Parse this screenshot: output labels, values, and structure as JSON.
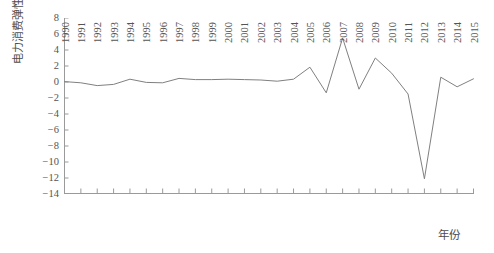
{
  "chart_data": {
    "type": "line",
    "title": "",
    "xlabel": "年份",
    "ylabel": "电力消费弹性系数",
    "categories": [
      1990,
      1991,
      1992,
      1993,
      1994,
      1995,
      1996,
      1997,
      1998,
      1999,
      2000,
      2001,
      2002,
      2003,
      2004,
      2005,
      2006,
      2007,
      2008,
      2009,
      2010,
      2011,
      2012,
      2013,
      2014,
      2015
    ],
    "x": [
      1990,
      1991,
      1992,
      1993,
      1994,
      1995,
      1996,
      1997,
      1998,
      1999,
      2000,
      2001,
      2002,
      2003,
      2004,
      2005,
      2006,
      2007,
      2008,
      2009,
      2010,
      2011,
      2012,
      2013,
      2014,
      2015
    ],
    "values": [
      0.05,
      -0.1,
      -0.45,
      -0.3,
      0.35,
      -0.05,
      -0.1,
      0.45,
      0.3,
      0.3,
      0.35,
      0.3,
      0.25,
      0.1,
      0.35,
      1.85,
      -1.35,
      5.5,
      -0.9,
      3.0,
      1.1,
      -1.5,
      -12.1,
      0.6,
      -0.6,
      0.4
    ],
    "series": [
      {
        "name": "电力消费弹性系数",
        "color": "#808080",
        "values": [
          0.05,
          -0.1,
          -0.45,
          -0.3,
          0.35,
          -0.05,
          -0.1,
          0.45,
          0.3,
          0.3,
          0.35,
          0.3,
          0.25,
          0.1,
          0.35,
          1.85,
          -1.35,
          5.5,
          -0.9,
          3.0,
          1.1,
          -1.5,
          -12.1,
          0.6,
          -0.6,
          0.4
        ]
      }
    ],
    "ylim": [
      -14,
      8
    ],
    "xlim": [
      1990,
      2015
    ],
    "yticks": [
      8,
      6,
      4,
      2,
      0,
      -2,
      -4,
      -6,
      -8,
      -10,
      -12,
      -14
    ],
    "ytick_labels": [
      "8",
      "6",
      "4",
      "2",
      "0",
      "−2",
      "−4",
      "−6",
      "−8",
      "−10",
      "−12",
      "−14"
    ],
    "xtick_labels": [
      "1990",
      "1991",
      "1992",
      "1993",
      "1994",
      "1995",
      "1996",
      "1997",
      "1998",
      "1999",
      "2000",
      "2001",
      "2002",
      "2003",
      "2004",
      "2005",
      "2006",
      "2007",
      "2008",
      "2009",
      "2010",
      "2011",
      "2012",
      "2013",
      "2014",
      "2015"
    ],
    "grid": false,
    "legend": false,
    "legend_position": "none",
    "line_color": "#808080",
    "axis_color": "#9a9a9a",
    "background": "#ffffff",
    "annotations": []
  },
  "axes": {
    "y_axis_title": "电力消费弹性系数",
    "x_axis_title": "年份"
  }
}
